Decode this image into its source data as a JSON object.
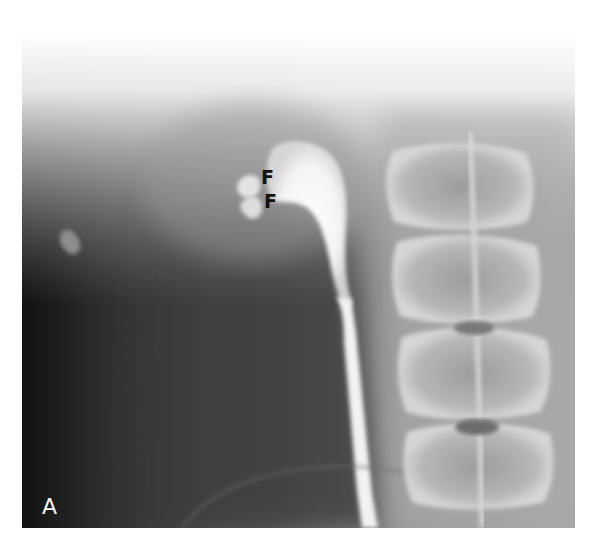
{
  "figure": {
    "panel_label": "A",
    "annotations": [
      {
        "id": "f1",
        "text": "F"
      },
      {
        "id": "f2",
        "text": "F"
      }
    ]
  }
}
